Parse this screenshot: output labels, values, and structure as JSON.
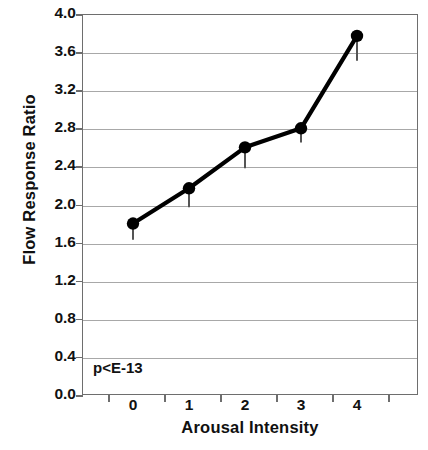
{
  "chart_data": {
    "type": "line",
    "title": "",
    "xlabel": "Arousal Intensity",
    "ylabel": "Flow Response Ratio",
    "categories": [
      "0",
      "1",
      "2",
      "3",
      "4"
    ],
    "x": [
      0,
      1,
      2,
      3,
      4
    ],
    "values": [
      1.8,
      2.17,
      2.6,
      2.8,
      3.77
    ],
    "error_low": [
      0.17,
      0.2,
      0.22,
      0.15,
      0.26
    ],
    "error_high": [
      0,
      0,
      0,
      0,
      0
    ],
    "ylim": [
      0.0,
      4.0
    ],
    "ytick_labels": [
      "0.0",
      "0.4",
      "0.8",
      "1.2",
      "1.6",
      "2.0",
      "2.4",
      "2.8",
      "3.2",
      "3.6",
      "4.0"
    ],
    "ytick_values": [
      0.0,
      0.4,
      0.8,
      1.2,
      1.6,
      2.0,
      2.4,
      2.8,
      3.2,
      3.6,
      4.0
    ],
    "grid": "horizontal",
    "legend": "none",
    "annotations": [
      {
        "text": "p<E-13",
        "x": 0.0,
        "y": 0.27
      }
    ],
    "series_color": "#000000",
    "marker": "circle",
    "marker_color": "#000000",
    "grid_color": "#a8a8a8",
    "axis_color": "#6e6e6e"
  }
}
